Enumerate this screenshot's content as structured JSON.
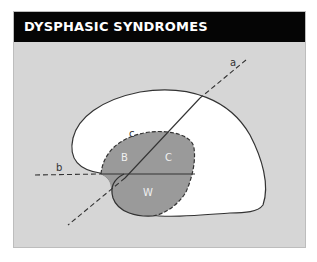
{
  "header": {
    "title": "DYSPHASIC SYNDROMES"
  },
  "diagram": {
    "labels": {
      "a": "a",
      "b": "b",
      "c": "c",
      "B": "B",
      "C": "C",
      "W": "W"
    },
    "colors": {
      "background": "#d6d6d6",
      "header": "#050505",
      "brain_fill": "#ffffff",
      "region_fill": "#9a9a9a",
      "outline": "#333333"
    }
  }
}
